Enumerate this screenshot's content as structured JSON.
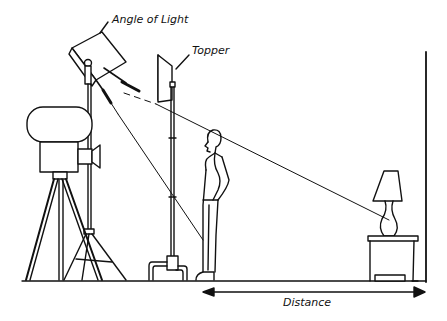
{
  "diagram": {
    "type": "illustration",
    "labels": {
      "angle_of_light": "Angle of Light",
      "topper": "Topper",
      "distance": "Distance"
    },
    "elements": [
      "spotlight-on-stand",
      "movie-camera-on-tripod",
      "topper-flag-on-stand",
      "standing-man",
      "table-lamp-on-nightstand",
      "back-wall",
      "floor-line",
      "distance-arrow"
    ],
    "colors": {
      "ink": "#111111",
      "background": "#ffffff"
    }
  }
}
